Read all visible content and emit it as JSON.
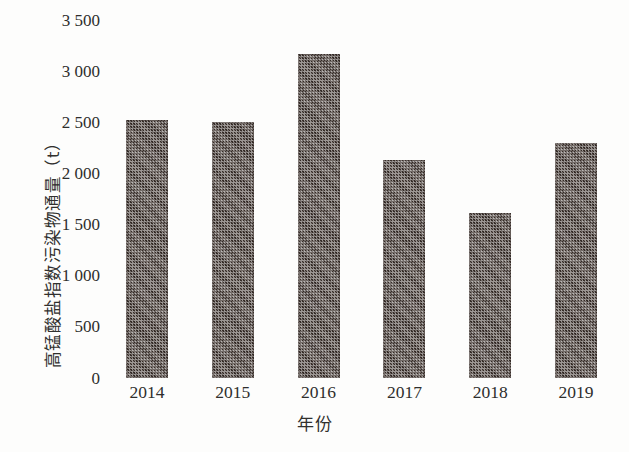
{
  "chart_data": {
    "type": "bar",
    "title": "",
    "subtitle": "",
    "xlabel": "年份",
    "ylabel": "高锰酸盐指数污染物通量（t）",
    "categories": [
      "2014",
      "2015",
      "2016",
      "2017",
      "2019",
      "2018"
    ],
    "x": [
      "2014",
      "2015",
      "2016",
      "2017",
      "2018",
      "2019"
    ],
    "values": [
      2520,
      2500,
      3170,
      2130,
      1610,
      2300
    ],
    "series": [
      {
        "name": "高锰酸盐指数污染物通量",
        "values": [
          2520,
          2500,
          3170,
          2130,
          1610,
          2300
        ]
      }
    ],
    "ylim": [
      0,
      3500
    ],
    "ytick_values": [
      0,
      500,
      1000,
      1500,
      2000,
      2500,
      3000,
      3500
    ],
    "ytick_labels": [
      "0",
      "500",
      "1 000",
      "1 500",
      "2 000",
      "2 500",
      "3 000",
      "3 500"
    ],
    "xtick_labels": [
      "2014",
      "2015",
      "2016",
      "2017",
      "2018",
      "2019"
    ],
    "grid": false,
    "legend": null,
    "legend_position": "none",
    "annotations": [],
    "bar_color": "#413733",
    "bar_fill_pattern": "checkered-dotted",
    "background_color": "#fdfdfc",
    "axis_line_visible": false
  },
  "axes": {
    "y": {
      "label": "高锰酸盐指数污染物通量（t）",
      "unit": "t",
      "ticks": [
        {
          "label": "3 500",
          "value": 3500
        },
        {
          "label": "3 000",
          "value": 3000
        },
        {
          "label": "2 500",
          "value": 2500
        },
        {
          "label": "2 000",
          "value": 2000
        },
        {
          "label": "1 500",
          "value": 1500
        },
        {
          "label": "1 000",
          "value": 1000
        },
        {
          "label": "500",
          "value": 500
        },
        {
          "label": "0",
          "value": 0
        }
      ]
    },
    "x": {
      "label": "年份",
      "ticks": [
        {
          "label": "2014"
        },
        {
          "label": "2015"
        },
        {
          "label": "2016"
        },
        {
          "label": "2017"
        },
        {
          "label": "2018"
        },
        {
          "label": "2019"
        }
      ]
    }
  },
  "bars": [
    {
      "category": "2014",
      "value": 2520
    },
    {
      "category": "2015",
      "value": 2500
    },
    {
      "category": "2016",
      "value": 3170
    },
    {
      "category": "2017",
      "value": 2130
    },
    {
      "category": "2018",
      "value": 1610
    },
    {
      "category": "2019",
      "value": 2300
    }
  ]
}
